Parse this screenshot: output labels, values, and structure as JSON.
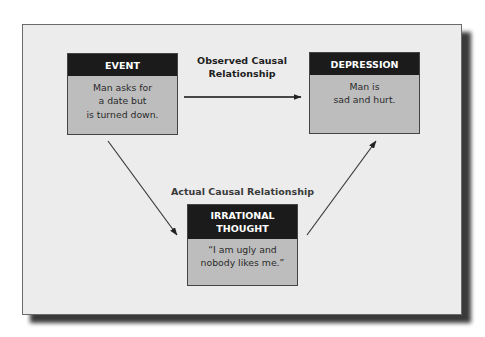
{
  "diagram": {
    "nodes": [
      {
        "id": "event",
        "header": "EVENT",
        "body": "Man asks for\na date but\nis turned down."
      },
      {
        "id": "depression",
        "header": "DEPRESSION",
        "body": "Man is\nsad and hurt."
      },
      {
        "id": "thought",
        "header": "IRRATIONAL\nTHOUGHT",
        "body": "“I am ugly and\nnobody likes me.”"
      }
    ],
    "edges": [
      {
        "from": "event",
        "to": "depression",
        "label": "Observed Causal\nRelationship"
      },
      {
        "from": "event",
        "to": "thought",
        "label": "Actual Causal Relationship"
      },
      {
        "from": "thought",
        "to": "depression",
        "label": ""
      }
    ],
    "labels": {
      "observed": "Observed Causal\nRelationship",
      "actual": "Actual Causal Relationship"
    },
    "colors": {
      "panel": "#ececec",
      "header": "#1b1b1b",
      "box_body": "#bdbdbd",
      "arrow": "#222222"
    }
  }
}
